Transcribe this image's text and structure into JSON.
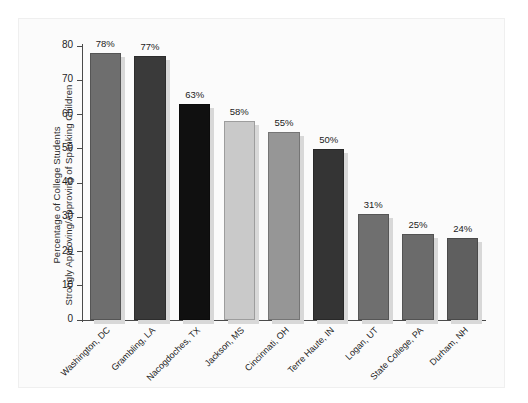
{
  "chart_data": {
    "type": "bar",
    "title": "",
    "xlabel": "",
    "ylabel": "Percentage of College Students Strongly Approving/Approving of Spanking Children",
    "ylabel_line1": "Percentage of College Students",
    "ylabel_line2": "Strongly Approving/Approving of Spanking Children",
    "ylim": [
      0,
      80
    ],
    "ytick_values": [
      0,
      10,
      20,
      30,
      40,
      50,
      60,
      70,
      80
    ],
    "ytick_labels": [
      "0",
      "10",
      "20",
      "30",
      "40",
      "50",
      "60",
      "70",
      "80"
    ],
    "grid": false,
    "legend": "none",
    "categories": [
      "Washington, DC",
      "Grambling, LA",
      "Nacogdoches, TX",
      "Jackson, MS",
      "Cincinnati, OH",
      "Terre Haute, IN",
      "Logan, UT",
      "State College, PA",
      "Durham, NH"
    ],
    "values": [
      78,
      77,
      63,
      58,
      55,
      50,
      31,
      25,
      24
    ],
    "data_labels": [
      "78%",
      "77%",
      "63%",
      "58%",
      "55%",
      "50%",
      "31%",
      "25%",
      "24%"
    ],
    "bar_colors": [
      "#6e6e6e",
      "#3a3a3a",
      "#101010",
      "#c9c9c9",
      "#969696",
      "#343434",
      "#6f6f6f",
      "#6b6b6b",
      "#5f5f5f"
    ]
  },
  "figure": {
    "background": "#fbfbfb",
    "axis_color": "#4a4a4a",
    "text_color": "#1c1c1c"
  }
}
